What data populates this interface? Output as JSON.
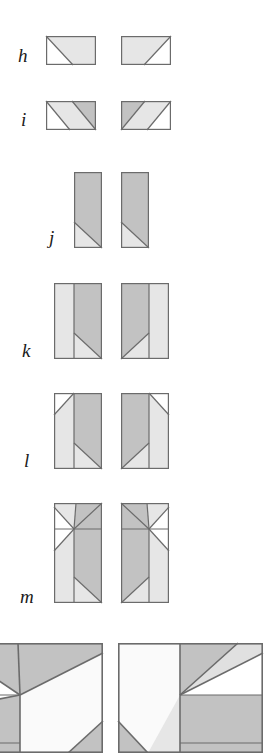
{
  "figure": {
    "title": "",
    "background_color": "#ffffff",
    "colors": {
      "white": "#ffffff",
      "light_gray": "#e4e4e4",
      "pale_gray": "#ededed",
      "medium_gray": "#c2c2c2",
      "dark_gray": "#b0b0b0",
      "stroke": "#6b6b6b",
      "label_color": "#1a1a1a"
    },
    "rows": [
      {
        "label": "h",
        "label_x": 18,
        "label_y": 48,
        "label_size": 19,
        "tiles": [
          {
            "name": "tile-h-left",
            "x": 46,
            "y": 36,
            "w": 50,
            "h": 29,
            "description": "rectangle cut by one diagonal from top-left corner to bottom edge; upper region light gray, lower-left region white"
          },
          {
            "name": "tile-h-right",
            "x": 121,
            "y": 36,
            "w": 50,
            "h": 29,
            "description": "rectangle cut by one diagonal from top-right corner to bottom edge; upper region light gray, lower-right region white"
          }
        ]
      },
      {
        "label": "i",
        "label_x": 20,
        "label_y": 112,
        "label_size": 19,
        "tiles": [
          {
            "name": "tile-i-left",
            "x": 46,
            "y": 101,
            "w": 50,
            "h": 29,
            "description": "rectangle cut by two parallel diagonals into three bands: white lower-left triangle, light gray middle band, medium gray upper-right triangle"
          },
          {
            "name": "tile-i-right",
            "x": 121,
            "y": 101,
            "w": 50,
            "h": 29,
            "description": "rectangle cut by two parallel diagonals into three bands: medium gray upper-left triangle, light gray middle band, white lower-right triangle"
          }
        ]
      },
      {
        "label": "j",
        "label_x": 48,
        "label_y": 232,
        "label_size": 19,
        "tiles": [
          {
            "name": "tile-j-left",
            "x": 74,
            "y": 172,
            "w": 28,
            "h": 76,
            "description": "tall rectangle, medium gray, with a small light gray triangle cut off the bottom-left corner by a diagonal"
          },
          {
            "name": "tile-j-right",
            "x": 121,
            "y": 172,
            "w": 28,
            "h": 76,
            "description": "tall rectangle, medium gray, with a small light gray triangle cut off the bottom-left corner by a diagonal"
          }
        ]
      },
      {
        "label": "k",
        "label_x": 22,
        "label_y": 345,
        "label_size": 19,
        "tiles": [
          {
            "name": "tile-k-left",
            "x": 54,
            "y": 283,
            "w": 48,
            "h": 76,
            "description": "tall rectangle split by a vertical line; left strip light gray, right part medium gray with a diagonal from the vertical line down to the bottom-right corner"
          },
          {
            "name": "tile-k-right",
            "x": 121,
            "y": 283,
            "w": 48,
            "h": 76,
            "description": "mirrored: left part medium gray with a diagonal, right strip light gray, vertical dividing line"
          }
        ]
      },
      {
        "label": "l",
        "label_x": 22,
        "label_y": 455,
        "label_size": 19,
        "tiles": [
          {
            "name": "tile-l-left",
            "x": 54,
            "y": 393,
            "w": 48,
            "h": 76,
            "description": "tall rectangle with vertical divider; white triangle at top-left cut by a diagonal, light gray left column, medium gray right column with a diagonal near the bottom"
          },
          {
            "name": "tile-l-right",
            "x": 121,
            "y": 393,
            "w": 48,
            "h": 76,
            "description": "mirrored version with white triangle at top-right"
          }
        ]
      },
      {
        "label": "m",
        "label_x": 20,
        "label_y": 594,
        "label_size": 19,
        "tiles": [
          {
            "name": "tile-m-left",
            "x": 54,
            "y": 503,
            "w": 48,
            "h": 100,
            "description": "tall rectangle with a horizontal divider near the top, vertical divider, and several diagonals creating white, light gray and medium gray regions"
          },
          {
            "name": "tile-m-right",
            "x": 121,
            "y": 503,
            "w": 48,
            "h": 100,
            "description": "mirrored version of the left tile"
          }
        ]
      },
      {
        "label": "",
        "label_x": 0,
        "label_y": 0,
        "label_size": 19,
        "tiles": [
          {
            "name": "tile-bottom-left",
            "x": -42,
            "y": 643,
            "w": 145,
            "h": 110,
            "description": "enlarged detail tile cropped by the image edge; large white central region bounded by diagonals with light and medium gray corner regions"
          },
          {
            "name": "tile-bottom-right",
            "x": 118,
            "y": 643,
            "w": 145,
            "h": 110,
            "description": "enlarged detail tile cropped by the right image edge; mirrored arrangement of the bottom-left tile"
          }
        ]
      }
    ]
  }
}
